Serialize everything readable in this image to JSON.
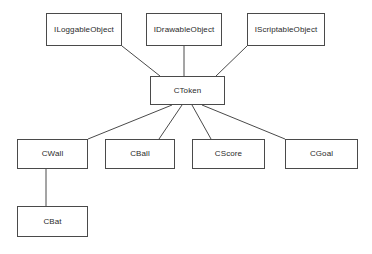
{
  "diagram": {
    "type": "uml-class-diagram",
    "canvas": {
      "width": 372,
      "height": 254,
      "background": "#ffffff"
    },
    "style": {
      "node_fill": "#ffffff",
      "node_border": "#4a4a4a",
      "edge_color": "#4a4a4a",
      "text_color": "#2b2b2b"
    },
    "nodes": [
      {
        "id": "ILoggableObject",
        "label": "ILoggableObject",
        "kind": "interface",
        "x": 46,
        "y": 13,
        "w": 76,
        "h": 33
      },
      {
        "id": "IDrawableObject",
        "label": "IDrawableObject",
        "kind": "interface",
        "x": 146,
        "y": 13,
        "w": 76,
        "h": 33
      },
      {
        "id": "IScriptableObject",
        "label": "IScriptableObject",
        "kind": "interface",
        "x": 247,
        "y": 13,
        "w": 78,
        "h": 33
      },
      {
        "id": "CToken",
        "label": "CToken",
        "kind": "class",
        "x": 150,
        "y": 76,
        "w": 75,
        "h": 29
      },
      {
        "id": "CWall",
        "label": "CWall",
        "kind": "class",
        "x": 17,
        "y": 139,
        "w": 71,
        "h": 30
      },
      {
        "id": "CBall",
        "label": "CBall",
        "kind": "class",
        "x": 105,
        "y": 139,
        "w": 70,
        "h": 30
      },
      {
        "id": "CScore",
        "label": "CScore",
        "kind": "class",
        "x": 192,
        "y": 139,
        "w": 73,
        "h": 30
      },
      {
        "id": "CGoal",
        "label": "CGoal",
        "kind": "class",
        "x": 285,
        "y": 139,
        "w": 73,
        "h": 30
      },
      {
        "id": "CBat",
        "label": "CBat",
        "kind": "class",
        "x": 17,
        "y": 206,
        "w": 71,
        "h": 31
      }
    ],
    "edges": [
      {
        "id": "e-ctoken-iloggable",
        "from": "CToken",
        "to": "ILoggableObject",
        "x1": 122,
        "y1": 46,
        "x2": 160,
        "y2": 76
      },
      {
        "id": "e-ctoken-idrawable",
        "from": "CToken",
        "to": "IDrawableObject",
        "x1": 184,
        "y1": 46,
        "x2": 184,
        "y2": 76
      },
      {
        "id": "e-ctoken-iscriptable",
        "from": "CToken",
        "to": "IScriptableObject",
        "x1": 247,
        "y1": 46,
        "x2": 216,
        "y2": 76
      },
      {
        "id": "e-ctoken-cwall",
        "from": "CToken",
        "to": "CWall",
        "x1": 172,
        "y1": 105,
        "x2": 88,
        "y2": 139
      },
      {
        "id": "e-ctoken-cball",
        "from": "CToken",
        "to": "CBall",
        "x1": 182,
        "y1": 105,
        "x2": 159,
        "y2": 139
      },
      {
        "id": "e-ctoken-cscore",
        "from": "CToken",
        "to": "CScore",
        "x1": 192,
        "y1": 105,
        "x2": 211,
        "y2": 139
      },
      {
        "id": "e-ctoken-cgoal",
        "from": "CToken",
        "to": "CGoal",
        "x1": 202,
        "y1": 105,
        "x2": 285,
        "y2": 139
      },
      {
        "id": "e-cwall-cbat",
        "from": "CWall",
        "to": "CBat",
        "x1": 46,
        "y1": 169,
        "x2": 46,
        "y2": 206
      }
    ]
  }
}
